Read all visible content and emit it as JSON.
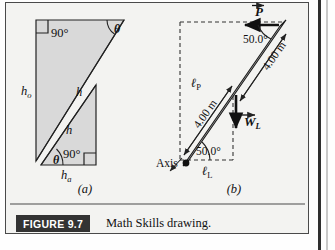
{
  "figure": {
    "caption_badge": "FIGURE 9.7",
    "caption_text": "Math Skills drawing.",
    "panels": [
      {
        "id": "a",
        "label": "(a)"
      },
      {
        "id": "b",
        "label": "(b)"
      }
    ]
  },
  "panel_a": {
    "title": "right triangles with similar angles",
    "labels": {
      "right_angle_top": "90°",
      "right_angle_bottom": "90°",
      "theta_top": "θ",
      "theta_bottom": "θ",
      "opposite_side": "h",
      "opposite_subscript": "o",
      "adjacent_side": "h",
      "adjacent_subscript": "a",
      "hypotenuse_large": "h",
      "hypotenuse_small": "h"
    }
  },
  "panel_b": {
    "title": "lever arm diagram",
    "labels": {
      "axis": "Axis",
      "force_P": "P",
      "force_W": "W",
      "force_W_subscript": "L",
      "angle_top": "50.0°",
      "angle_bottom": "50.0°",
      "length_upper": "4.00 m",
      "length_lower": "4.00 m",
      "lever_arm_P": "ℓ",
      "lever_arm_P_subscript": "P",
      "lever_arm_L": "ℓ",
      "lever_arm_L_subscript": "L"
    }
  },
  "colors": {
    "page_background": "#fefefe",
    "panel_background": "#f3f3f1",
    "shape_fill": "#d9d9d9",
    "rod_fill": "#b9b9b9",
    "ink": "#111111",
    "badge_background": "#333333",
    "badge_text": "#ffffff",
    "frame_border": "#4a4a4a"
  }
}
